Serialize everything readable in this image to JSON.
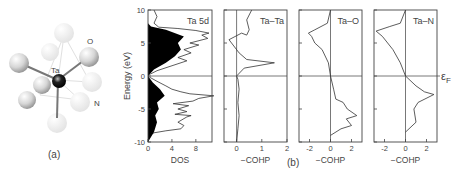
{
  "figure": {
    "panel_a": {
      "label": "(a)",
      "atoms": {
        "center": "Ta",
        "ligand1": "O",
        "ligand2": "N"
      }
    },
    "panel_b": {
      "label": "(b)",
      "fermi_label": "ε",
      "fermi_sub": "F"
    }
  },
  "chart_data": [
    {
      "type": "line",
      "title": "Ta 5d",
      "xlabel": "DOS",
      "ylabel": "Energy (eV)",
      "xticks": [
        "0",
        "4",
        "8"
      ],
      "yticks": [
        "10",
        "5",
        "0",
        "-5",
        "-10"
      ],
      "xlim": [
        0,
        10.7
      ],
      "ylim": [
        -10,
        10
      ],
      "filled": "projected Ta 5d (black fill) over total DOS outline",
      "series": [
        {
          "name": "total DOS",
          "points": [
            [
              0,
              -10
            ],
            [
              0.2,
              -9
            ],
            [
              1,
              -8.6
            ],
            [
              3,
              -8.3
            ],
            [
              5.5,
              -8
            ],
            [
              6,
              -7.5
            ],
            [
              5,
              -7
            ],
            [
              6.5,
              -6.2
            ],
            [
              7.2,
              -6
            ],
            [
              4.5,
              -5.8
            ],
            [
              6.5,
              -5.4
            ],
            [
              5,
              -5
            ],
            [
              6.8,
              -4.5
            ],
            [
              4.2,
              -4.2
            ],
            [
              7.5,
              -3.8
            ],
            [
              8.5,
              -3.4
            ],
            [
              11,
              -3
            ],
            [
              7,
              -2.7
            ],
            [
              5.5,
              -2.4
            ],
            [
              4,
              -2
            ],
            [
              3,
              -1.5
            ],
            [
              1.5,
              -0.8
            ],
            [
              0.3,
              -0.2
            ],
            [
              0,
              0
            ],
            [
              0.4,
              0.3
            ],
            [
              1.5,
              0.8
            ],
            [
              6.5,
              2.3
            ],
            [
              5,
              2.8
            ],
            [
              7.2,
              3.5
            ],
            [
              6,
              4
            ],
            [
              8.5,
              4.7
            ],
            [
              7,
              5
            ],
            [
              10,
              5.7
            ],
            [
              9,
              6.2
            ],
            [
              10.2,
              6.5
            ],
            [
              8,
              6.9
            ],
            [
              5,
              7.2
            ],
            [
              1.8,
              7.4
            ],
            [
              1,
              8
            ],
            [
              1.5,
              9
            ],
            [
              1,
              10
            ]
          ]
        },
        {
          "name": "Ta 5d",
          "points": [
            [
              0,
              -10
            ],
            [
              1,
              -8.5
            ],
            [
              1.5,
              -7
            ],
            [
              1.2,
              -6
            ],
            [
              1.8,
              -5
            ],
            [
              1.5,
              -4
            ],
            [
              2.8,
              -3
            ],
            [
              2,
              -2
            ],
            [
              0.8,
              -1
            ],
            [
              0,
              0
            ],
            [
              1,
              1
            ],
            [
              3,
              2
            ],
            [
              4.5,
              3
            ],
            [
              5.5,
              4
            ],
            [
              5,
              5
            ],
            [
              6,
              6
            ],
            [
              3,
              7
            ],
            [
              0.5,
              7.5
            ],
            [
              0,
              8
            ]
          ]
        }
      ]
    },
    {
      "type": "line",
      "title": "Ta–Ta",
      "xlabel": "−COHP",
      "xticks": [
        "0",
        "1",
        "2"
      ],
      "xlim": [
        -0.5,
        2
      ],
      "ylim": [
        -10,
        10
      ],
      "series": [
        {
          "name": "Ta–Ta",
          "points": [
            [
              0,
              -10
            ],
            [
              0.05,
              -8
            ],
            [
              0.1,
              -6
            ],
            [
              0.05,
              -4
            ],
            [
              0.1,
              -2
            ],
            [
              0.05,
              -0.5
            ],
            [
              0,
              0
            ],
            [
              0.3,
              1.2
            ],
            [
              1.5,
              2
            ],
            [
              0.4,
              2.5
            ],
            [
              0.1,
              3.5
            ],
            [
              -0.3,
              5.5
            ],
            [
              0.2,
              6.5
            ],
            [
              0.4,
              6.2
            ],
            [
              0.5,
              7
            ],
            [
              0.4,
              8.5
            ],
            [
              0.6,
              10
            ]
          ]
        }
      ]
    },
    {
      "type": "line",
      "title": "Ta–O",
      "xlabel": "−COHP",
      "xticks": [
        "-2",
        "0",
        "2"
      ],
      "xlim": [
        -3,
        3
      ],
      "ylim": [
        -10,
        10
      ],
      "series": [
        {
          "name": "Ta–O",
          "points": [
            [
              0,
              -9
            ],
            [
              1,
              -8
            ],
            [
              2,
              -7.5
            ],
            [
              1.5,
              -6.5
            ],
            [
              2.5,
              -6
            ],
            [
              1.6,
              -5
            ],
            [
              1.2,
              -4
            ],
            [
              0.5,
              -3.5
            ],
            [
              0.3,
              -2
            ],
            [
              0,
              0
            ],
            [
              -0.2,
              2
            ],
            [
              -0.8,
              4
            ],
            [
              -1.5,
              5
            ],
            [
              -1.8,
              6
            ],
            [
              -2.1,
              6.5
            ],
            [
              -1.5,
              7
            ],
            [
              -0.3,
              8
            ],
            [
              0,
              10
            ]
          ]
        }
      ]
    },
    {
      "type": "line",
      "title": "Ta–N",
      "xlabel": "−COHP",
      "xticks": [
        "-2",
        "0",
        "2"
      ],
      "xlim": [
        -3,
        3
      ],
      "ylim": [
        -10,
        10
      ],
      "series": [
        {
          "name": "Ta–N",
          "points": [
            [
              0,
              -8.5
            ],
            [
              1,
              -7
            ],
            [
              0.8,
              -5
            ],
            [
              1.2,
              -4
            ],
            [
              2.7,
              -2.8
            ],
            [
              1.8,
              -2.4
            ],
            [
              1,
              -1.5
            ],
            [
              0,
              0
            ],
            [
              -0.5,
              2
            ],
            [
              -1.2,
              4
            ],
            [
              -2.2,
              6
            ],
            [
              -2.8,
              6.8
            ],
            [
              -1.5,
              7.5
            ],
            [
              -0.5,
              8
            ],
            [
              0,
              10
            ]
          ]
        }
      ]
    }
  ]
}
